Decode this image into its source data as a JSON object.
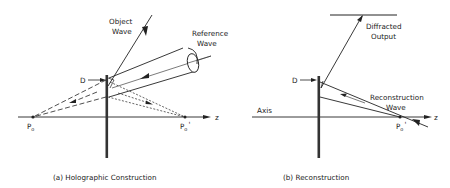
{
  "panel_a": {
    "caption": "(a) Holographic Construction",
    "labels": {
      "object_wave_line1": "Object",
      "object_wave_line2": "Wave",
      "reference_wave_line1": "Reference",
      "reference_wave_line2": "Wave",
      "d": "D",
      "p0": "P",
      "p0_sub": "o",
      "p0prime": "P",
      "p0prime_sub": "o",
      "p0prime_mark": "'",
      "z": "z"
    }
  },
  "panel_b": {
    "caption": "(b) Reconstruction",
    "labels": {
      "diffracted_line1": "Diffracted",
      "diffracted_line2": "Output",
      "reconstruction_line1": "Reconstruction",
      "reconstruction_line2": "Wave",
      "axis": "Axis",
      "d": "D",
      "p0prime": "P",
      "p0prime_sub": "o",
      "p0prime_mark": "'",
      "z": "z"
    }
  },
  "colors": {
    "ink": "#222222",
    "background": "#ffffff"
  }
}
